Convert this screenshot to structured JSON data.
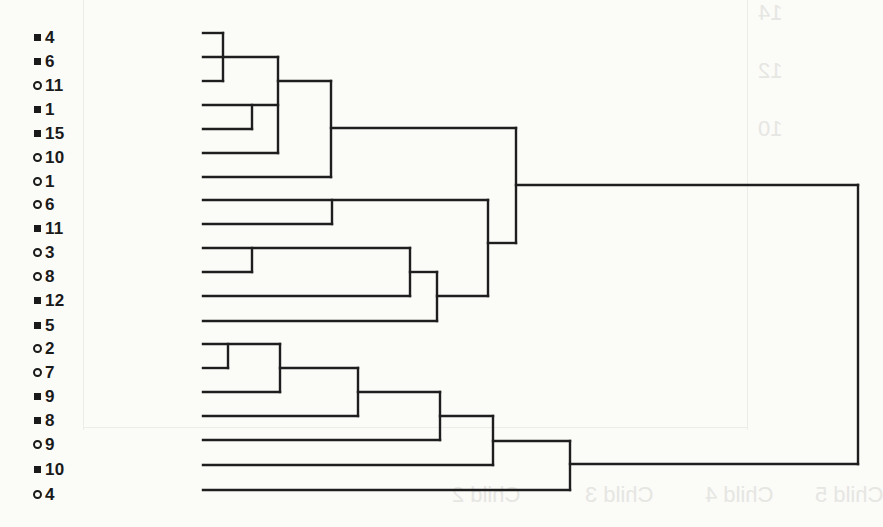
{
  "style": {
    "background": "#fbfbf8",
    "line_color": "#1e1e1e",
    "line_width": 2.4,
    "label_color": "#1a1a1a",
    "ghost_color": "#e6e6e2"
  },
  "chart_data": {
    "type": "dendrogram",
    "title": "",
    "xlabel": "",
    "ylabel": "",
    "orientation": "leaves on left, root on right",
    "axis": "none",
    "grid": false,
    "marker_legend": {
      "square": "filled square marker",
      "circle": "open circle marker"
    },
    "leaves": [
      {
        "label": "4",
        "marker": "square",
        "y": 33
      },
      {
        "label": "6",
        "marker": "square",
        "y": 57
      },
      {
        "label": "11",
        "marker": "circle",
        "y": 81
      },
      {
        "label": "1",
        "marker": "square",
        "y": 105
      },
      {
        "label": "15",
        "marker": "square",
        "y": 129
      },
      {
        "label": "10",
        "marker": "circle",
        "y": 153
      },
      {
        "label": "1",
        "marker": "circle",
        "y": 177
      },
      {
        "label": "6",
        "marker": "circle",
        "y": 200
      },
      {
        "label": "11",
        "marker": "square",
        "y": 224
      },
      {
        "label": "3",
        "marker": "circle",
        "y": 248
      },
      {
        "label": "8",
        "marker": "circle",
        "y": 272
      },
      {
        "label": "12",
        "marker": "square",
        "y": 296
      },
      {
        "label": "5",
        "marker": "square",
        "y": 321
      },
      {
        "label": "2",
        "marker": "circle",
        "y": 344
      },
      {
        "label": "7",
        "marker": "circle",
        "y": 368
      },
      {
        "label": "9",
        "marker": "square",
        "y": 392
      },
      {
        "label": "8",
        "marker": "square",
        "y": 416
      },
      {
        "label": "9",
        "marker": "circle",
        "y": 440
      },
      {
        "label": "10",
        "marker": "square",
        "y": 465
      },
      {
        "label": "4",
        "marker": "circle",
        "y": 490
      }
    ],
    "merges_relative_height_px": [
      {
        "members": [
          "■4",
          "■6",
          "○11"
        ],
        "height": 20
      },
      {
        "members": [
          "■1",
          "■15"
        ],
        "height": 49
      },
      {
        "members": [
          "{■4,■6,○11}",
          "{■1,■15}",
          "○10"
        ],
        "height": 75
      },
      {
        "members": [
          "{■4..○10}",
          "○1"
        ],
        "height": 128
      },
      {
        "members": [
          "○6",
          "■11"
        ],
        "height": 129
      },
      {
        "members": [
          "○3",
          "○8"
        ],
        "height": 49
      },
      {
        "members": [
          "{○3,○8}",
          "■12"
        ],
        "height": 207
      },
      {
        "members": [
          "{○3,○8,■12}",
          "■5"
        ],
        "height": 234
      },
      {
        "members": [
          "{○6,■11}",
          "{○3,○8,■12,■5}"
        ],
        "height": 285
      },
      {
        "members": [
          "{■4..○1}",
          "{○6..■5}"
        ],
        "height": 313
      },
      {
        "members": [
          "○2",
          "○7"
        ],
        "height": 25
      },
      {
        "members": [
          "{○2,○7}",
          "■9"
        ],
        "height": 77
      },
      {
        "members": [
          "{○2,○7,■9}",
          "■8"
        ],
        "height": 155
      },
      {
        "members": [
          "{○2..■8}",
          "○9"
        ],
        "height": 237
      },
      {
        "members": [
          "{○2..○9}",
          "■10"
        ],
        "height": 290
      },
      {
        "members": [
          "{○2..■10}",
          "○4"
        ],
        "height": 367
      },
      {
        "members": [
          "{■4..■5}",
          "{○2..○4}"
        ],
        "height": 655
      }
    ],
    "segments": [
      [
        203,
        33,
        223,
        33
      ],
      [
        203,
        57,
        278,
        57
      ],
      [
        203,
        81,
        223,
        81
      ],
      [
        223,
        33,
        223,
        81
      ],
      [
        203,
        105,
        278,
        105
      ],
      [
        203,
        129,
        252,
        129
      ],
      [
        252,
        105,
        252,
        129
      ],
      [
        203,
        153,
        278,
        153
      ],
      [
        278,
        57,
        278,
        153
      ],
      [
        278,
        81,
        331,
        81
      ],
      [
        203,
        177,
        331,
        177
      ],
      [
        331,
        81,
        331,
        177
      ],
      [
        331,
        128,
        516,
        128
      ],
      [
        203,
        200,
        488,
        200
      ],
      [
        203,
        224,
        332,
        224
      ],
      [
        332,
        200,
        332,
        224
      ],
      [
        203,
        248,
        410,
        248
      ],
      [
        203,
        272,
        252,
        272
      ],
      [
        252,
        248,
        252,
        272
      ],
      [
        203,
        296,
        410,
        296
      ],
      [
        410,
        248,
        410,
        296
      ],
      [
        410,
        272,
        437,
        272
      ],
      [
        203,
        321,
        437,
        321
      ],
      [
        437,
        272,
        437,
        321
      ],
      [
        437,
        296,
        488,
        296
      ],
      [
        488,
        200,
        488,
        296
      ],
      [
        488,
        243,
        516,
        243
      ],
      [
        516,
        128,
        516,
        243
      ],
      [
        516,
        185,
        858,
        185
      ],
      [
        858,
        185,
        858,
        464
      ],
      [
        203,
        344,
        280,
        344
      ],
      [
        203,
        368,
        228,
        368
      ],
      [
        228,
        344,
        228,
        368
      ],
      [
        203,
        392,
        280,
        392
      ],
      [
        280,
        344,
        280,
        392
      ],
      [
        280,
        368,
        358,
        368
      ],
      [
        203,
        416,
        358,
        416
      ],
      [
        358,
        368,
        358,
        416
      ],
      [
        358,
        392,
        440,
        392
      ],
      [
        203,
        440,
        440,
        440
      ],
      [
        440,
        392,
        440,
        440
      ],
      [
        440,
        416,
        493,
        416
      ],
      [
        203,
        465,
        493,
        465
      ],
      [
        493,
        416,
        493,
        465
      ],
      [
        493,
        441,
        570,
        441
      ],
      [
        203,
        490,
        570,
        490
      ],
      [
        570,
        441,
        570,
        490
      ],
      [
        570,
        464,
        858,
        464
      ]
    ]
  },
  "ghost_show_through": {
    "lines": [
      {
        "x": 83,
        "y": 0,
        "w": 1,
        "h": 430
      },
      {
        "x": 747,
        "y": 0,
        "w": 1,
        "h": 430
      },
      {
        "x": 83,
        "y": 427,
        "w": 665,
        "h": 1
      }
    ],
    "texts": [
      {
        "text": "Child 2",
        "x": 452,
        "y": 484
      },
      {
        "text": "Child 3",
        "x": 585,
        "y": 484
      },
      {
        "text": "Child 4",
        "x": 705,
        "y": 484
      },
      {
        "text": "Child 5",
        "x": 815,
        "y": 484
      },
      {
        "text": "14",
        "x": 758,
        "y": 2
      },
      {
        "text": "12",
        "x": 758,
        "y": 60
      },
      {
        "text": "10",
        "x": 758,
        "y": 118
      }
    ]
  }
}
